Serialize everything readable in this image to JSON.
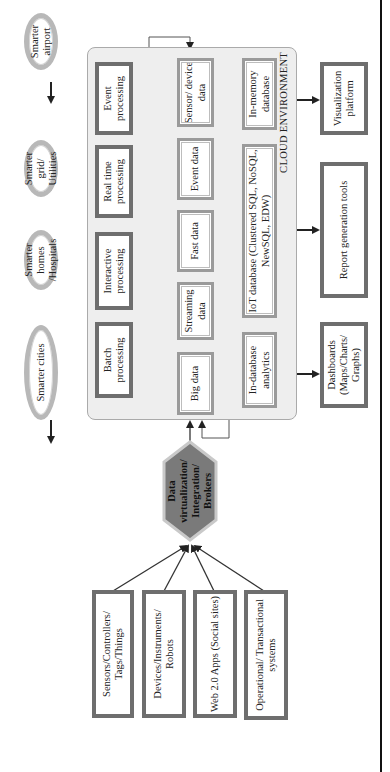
{
  "diagram": {
    "title": "",
    "orientation": "rotated 90° counter-clockwise (text reads bottom-to-top)",
    "sources": [
      {
        "label": "Sensors/Controllers/ Tags/Things"
      },
      {
        "label": "Devices/Instruments/ Robots"
      },
      {
        "label": "Web 2.0 Apps (Social sites)"
      },
      {
        "label": "Operational/ Transactional systems"
      }
    ],
    "broker": {
      "label": "Data virtualization/ Integration/ Brokers",
      "fill": "#7a7a7a"
    },
    "cloud": {
      "label": "CLOUD ENVIRONMENT",
      "processing": [
        {
          "label": "Batch processing"
        },
        {
          "label": "Interactive processing"
        },
        {
          "label": "Real time processing"
        },
        {
          "label": "Event processing"
        }
      ],
      "data_types": [
        {
          "label": "Big data"
        },
        {
          "label": "Streaming data"
        },
        {
          "label": "Fast data"
        },
        {
          "label": "Event data"
        },
        {
          "label": "Sensor/ device data"
        }
      ],
      "databases": [
        {
          "label": "In-database analytics"
        },
        {
          "label": "IoT database (Clustered SQL, NoSQL, NewSQL, EDW)"
        },
        {
          "label": "In-memory database"
        }
      ]
    },
    "applications": [
      {
        "label": "Smarter cities"
      },
      {
        "label": "Smarter homes /Hospitals"
      },
      {
        "label": "Smarter grid/ Utilities"
      },
      {
        "label": "Smarter airport"
      }
    ],
    "outputs": [
      {
        "label": "Dashboards (Maps/Charts/ Graphs)"
      },
      {
        "label": "Report generation tools"
      },
      {
        "label": "Visualization platform"
      }
    ],
    "colors": {
      "dark_border": "#6e6e6e",
      "light_border": "#9a9a9a",
      "cloud_fill": "#eeeeee",
      "oval_ring": "#b8b8b8",
      "hex_fill": "#7a7a7a"
    }
  }
}
